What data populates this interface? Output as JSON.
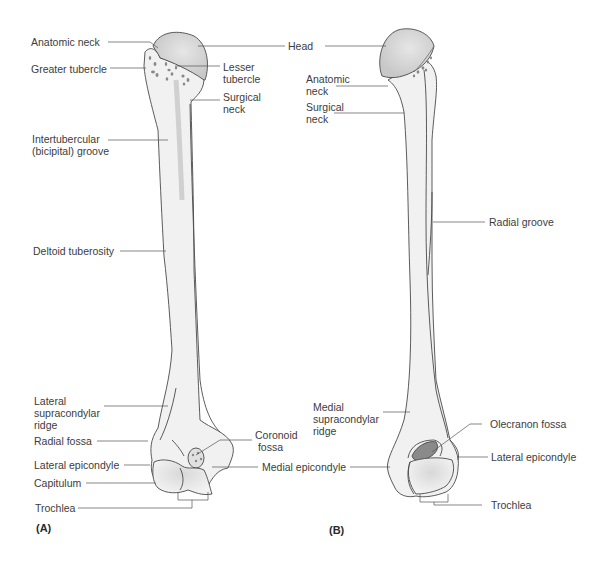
{
  "figure": {
    "colors": {
      "background": "#ffffff",
      "bone_fill": "#f1f1f1",
      "bone_outline": "#4a4a4a",
      "head_fill": "#d6d6d6",
      "fossa_fill": "#8a8a8a",
      "leader_line": "#555555",
      "text": "#3c3c3c"
    }
  },
  "panels": [
    {
      "id": "A",
      "letter": "(A)",
      "labels": {
        "anatomic_neck": "Anatomic neck",
        "greater_tubercle": "Greater tubercle",
        "head": "Head",
        "lesser_tubercle": "Lesser\ntubercle",
        "surgical_neck": "Surgical\nneck",
        "intertubercular_groove": "Intertubercular\n(bicipital) groove",
        "deltoid_tuberosity": "Deltoid tuberosity",
        "lateral_supracondylar_ridge": "Lateral\nsupracondylar\nridge",
        "radial_fossa": "Radial fossa",
        "coronoid_fossa": "Coronoid\n fossa",
        "lateral_epicondyle": "Lateral epicondyle",
        "medial_epicondyle": "Medial epicondyle",
        "capitulum": "Capitulum",
        "trochlea": "Trochlea"
      }
    },
    {
      "id": "B",
      "letter": "(B)",
      "labels": {
        "anatomic_neck": "Anatomic\nneck",
        "surgical_neck": "Surgical\nneck",
        "radial_groove": "Radial groove",
        "medial_supracondylar_ridge": "Medial\nsupracondylar\nridge",
        "olecranon_fossa": "Olecranon fossa",
        "lateral_epicondyle": "Lateral epicondyle",
        "trochlea": "Trochlea"
      }
    }
  ]
}
